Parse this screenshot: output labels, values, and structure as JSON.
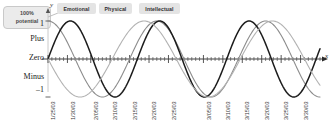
{
  "callout": {
    "line1": "100%",
    "line2": "potential",
    "icon": "leader-line"
  },
  "axes": {
    "y_name": "y",
    "x_name": "x",
    "y_labels": {
      "plus": "Plus",
      "zero": "Zero",
      "minus": "Minus",
      "top_value": "1",
      "bottom_value": "–1"
    },
    "x_tick_labels": [
      "1/25/03",
      "1/30/03",
      "2/05/03",
      "2/10/03",
      "2/15/03",
      "2/20/03",
      "2/25/03",
      "3/05/03",
      "3/10/03",
      "3/15/03",
      "3/20/03",
      "3/25/03",
      "3/30/03"
    ]
  },
  "legend": [
    {
      "label": "Emotional",
      "color": "#8c8c8c"
    },
    {
      "label": "Physical",
      "color": "#1c1c1c"
    },
    {
      "label": "Intellectual",
      "color": "#b2b2b2"
    }
  ],
  "chart_data": {
    "type": "line",
    "title": "",
    "xlabel": "x",
    "ylabel": "y",
    "ylim": [
      -1,
      1
    ],
    "grid": false,
    "legend_position": "top",
    "y_category_labels": [
      "Plus",
      "Zero",
      "Minus"
    ],
    "x": [
      "1/25/03",
      "1/30/03",
      "2/05/03",
      "2/10/03",
      "2/15/03",
      "2/20/03",
      "2/25/03",
      "3/05/03",
      "3/10/03",
      "3/15/03",
      "3/20/03",
      "3/25/03",
      "3/30/03"
    ],
    "series": [
      {
        "name": "Emotional",
        "cycle_days": 28,
        "amplitude": 1,
        "phase_deg": 90,
        "color": "#8c8c8c",
        "stroke_width": 1.1,
        "values": [
          1,
          0.22,
          -0.9,
          -0.78,
          0.22,
          0.97,
          0.43,
          -0.9,
          -0.62,
          0.43,
          1,
          0.22,
          -0.9
        ]
      },
      {
        "name": "Physical",
        "cycle_days": 23,
        "amplitude": 1,
        "phase_deg": 0,
        "color": "#1c1c1c",
        "stroke_width": 1.5,
        "values": [
          0,
          0.99,
          0.41,
          -0.51,
          -0.99,
          -0.27,
          0.63,
          0.99,
          0.27,
          -0.74,
          -0.96,
          0.0,
          0.87
        ]
      },
      {
        "name": "Intellectual",
        "cycle_days": 33,
        "amplitude": 1,
        "phase_deg": 180,
        "color": "#b2b2b2",
        "stroke_width": 1.1,
        "values": [
          -1,
          -0.63,
          0.28,
          0.92,
          0.85,
          0.09,
          -0.75,
          -0.98,
          -0.37,
          0.57,
          1,
          0.48,
          -0.45
        ]
      }
    ]
  }
}
